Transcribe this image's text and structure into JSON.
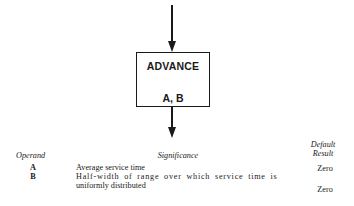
{
  "diagram": {
    "block": {
      "name": "ADVANCE",
      "operands": "A, B"
    }
  },
  "table": {
    "headers": {
      "operand": "Operand",
      "significance": "Significance",
      "default_line1": "Default",
      "default_line2": "Result"
    },
    "rows": [
      {
        "operand": "A",
        "significance_lines": [
          "Average service time"
        ],
        "default": "Zero"
      },
      {
        "operand": "B",
        "significance_lines": [
          "Half-width of range over which service time is",
          "uniformly distributed"
        ],
        "default": "Zero"
      }
    ]
  }
}
